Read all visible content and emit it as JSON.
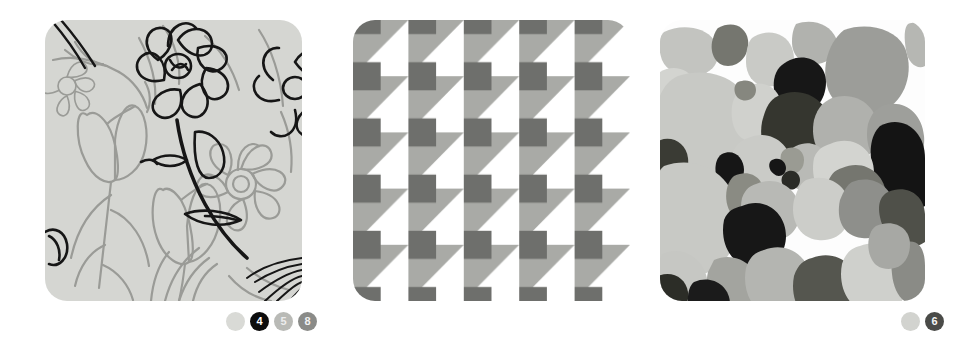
{
  "figure": {
    "width": 976,
    "height": 357,
    "background": "#ffffff",
    "panel_count": 3
  },
  "panels": [
    {
      "id": "panel-1",
      "name": "floral-line-art-texture",
      "description": "Floral line drawing texture, tulips and daisies outlined on light gray ground",
      "background_color": "#d5d6d2",
      "corner_radius": 22,
      "legend": {
        "name": "cluster-legend-1",
        "badges": [
          {
            "label": "",
            "kind": "swatch",
            "fill": "#d9dad6",
            "text_color": "#d9dad6"
          },
          {
            "label": "4",
            "kind": "numbered",
            "fill": "#0d0d0d",
            "text_color": "#ffffff"
          },
          {
            "label": "5",
            "kind": "numbered",
            "fill": "#b9bab6",
            "text_color": "#ededed"
          },
          {
            "label": "8",
            "kind": "numbered",
            "fill": "#8a8b88",
            "text_color": "#f2f2f2"
          }
        ]
      }
    },
    {
      "id": "panel-2",
      "name": "checker-triangle-texture",
      "description": "Geometric checkerboard of mid-gray triangles, dark gray squares and white ground",
      "background_color": "#ffffff",
      "corner_radius": 22,
      "palette": {
        "white": "#ffffff",
        "mid_gray": "#a9aaa6",
        "dark_gray": "#6e6f6c"
      },
      "legend": {
        "name": "cluster-legend-2",
        "badges": [
          {
            "label": "",
            "kind": "swatch",
            "fill": "#d2d3cf",
            "text_color": "#d2d3cf"
          },
          {
            "label": "6",
            "kind": "numbered",
            "fill": "#4a4b48",
            "text_color": "#f5f5f5"
          }
        ]
      }
    },
    {
      "id": "panel-3",
      "name": "pebble-mosaic-texture",
      "description": "Mosaic of rounded pebbles in light, mid, dark gray and black on white grout",
      "background_color": "#fdfdfd",
      "corner_radius": 22,
      "palette": {
        "grout": "#fdfdfd",
        "light": "#c3c4c0",
        "light2": "#d3d4d0",
        "mid": "#a1a29e",
        "mid_dark": "#7c7d7a",
        "dark": "#4e4f4c",
        "black": "#171717"
      },
      "legend": {
        "name": "cluster-legend-3",
        "badges": [
          {
            "label": "",
            "kind": "swatch",
            "fill": "#d1d2ce",
            "text_color": "#d1d2ce"
          },
          {
            "label": "1",
            "kind": "numbered",
            "fill": "#d9dad6",
            "text_color": "#a3a4a0"
          },
          {
            "label": "2",
            "kind": "numbered",
            "fill": "#c4c5c1",
            "text_color": "#8b8c88"
          },
          {
            "label": "3",
            "kind": "numbered",
            "fill": "#8d8e8a",
            "text_color": "#efefef"
          },
          {
            "label": "4",
            "kind": "numbered",
            "fill": "#0d0d0d",
            "text_color": "#ffffff"
          },
          {
            "label": "5",
            "kind": "numbered",
            "fill": "#bcbdb9",
            "text_color": "#e8e8e8"
          },
          {
            "label": "7",
            "kind": "numbered",
            "fill": "#3b3c39",
            "text_color": "#ffffff"
          },
          {
            "label": "8",
            "kind": "numbered",
            "fill": "#8a8b87",
            "text_color": "#f2f2f2"
          }
        ]
      }
    }
  ]
}
